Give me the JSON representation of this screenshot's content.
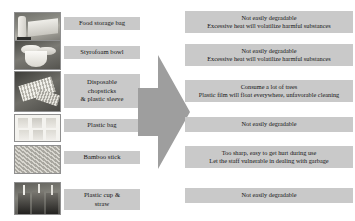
{
  "rows": [
    {
      "photo": "food-storage-bag-photo",
      "label": "Food storage bag",
      "label_lines": [
        "Food storage bag"
      ],
      "description_lines": [
        "Not easily degradable",
        "Excessive heat will volatilize harmful substances"
      ]
    },
    {
      "photo": "styrofoam-bowl-photo",
      "label": "Styrofoam bowl",
      "label_lines": [
        "Styrofoam bowl"
      ],
      "description_lines": [
        "Not easily degradable",
        "Excessive heat will volatilize harmful substances"
      ]
    },
    {
      "photo": "disposable-chopsticks-photo",
      "label": "Disposable chopsticks & plastic sleeve",
      "label_lines": [
        "Disposable",
        "chopsticks",
        "& plastic sleeve"
      ],
      "description_lines": [
        "Consume a lot of trees",
        "Plastic film will float everywhere, unfavorable cleaning"
      ]
    },
    {
      "photo": "plastic-bag-photo",
      "label": "Plastic bag",
      "label_lines": [
        "Plastic bag"
      ],
      "description_lines": [
        "Not easily degradable"
      ]
    },
    {
      "photo": "bamboo-stick-photo",
      "label": "Bamboo stick",
      "label_lines": [
        "Bamboo stick"
      ],
      "description_lines": [
        "Too sharp, easy to get hurt during use",
        "Let the staff vulnerable in dealing with garbage"
      ]
    },
    {
      "photo": "plastic-cup-straw-photo",
      "label": "Plastic cup & straw",
      "label_lines": [
        "Plastic cup &",
        "straw"
      ],
      "description_lines": [
        "Not easily degradable"
      ]
    }
  ],
  "arrow": {
    "icon": "right-arrow-icon",
    "direction": "right",
    "color": "#9e9e9e"
  },
  "colors": {
    "box_fill": "#c9c9c9",
    "arrow_fill": "#9e9e9e",
    "page_bg": "#ffffff",
    "text": "#141414"
  }
}
